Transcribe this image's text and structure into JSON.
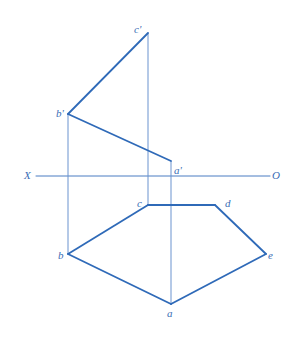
{
  "figure": {
    "colors": {
      "object_line": "#2f6ab8",
      "projector_line": "#6b93cf",
      "axis_line": "#4a7cc2",
      "label": "#3a6db5",
      "background": "#ffffff"
    },
    "axis": {
      "left_label": "X",
      "right_label": "O",
      "x1": 36,
      "x2": 270,
      "y": 176
    },
    "points": {
      "c_prime": {
        "label": "c'",
        "x": 148,
        "y": 33
      },
      "b_prime": {
        "label": "b'",
        "x": 68,
        "y": 114
      },
      "a_prime": {
        "label": "a'",
        "x": 171,
        "y": 161
      },
      "a": {
        "label": "a",
        "x": 171,
        "y": 304
      },
      "b": {
        "label": "b",
        "x": 68,
        "y": 254
      },
      "c": {
        "label": "c",
        "x": 148,
        "y": 205
      },
      "d": {
        "label": "d",
        "x": 215,
        "y": 205
      },
      "e": {
        "label": "e",
        "x": 266,
        "y": 254
      }
    },
    "front_view_edges": [
      [
        "c_prime",
        "b_prime"
      ],
      [
        "b_prime",
        "a_prime"
      ]
    ],
    "top_view_edges": [
      [
        "b",
        "c"
      ],
      [
        "c",
        "d"
      ],
      [
        "d",
        "e"
      ],
      [
        "e",
        "a"
      ],
      [
        "a",
        "b"
      ]
    ],
    "projectors": [
      [
        "b_prime",
        "b"
      ],
      [
        "c_prime",
        "c"
      ],
      [
        "a_prime",
        "a"
      ]
    ]
  }
}
